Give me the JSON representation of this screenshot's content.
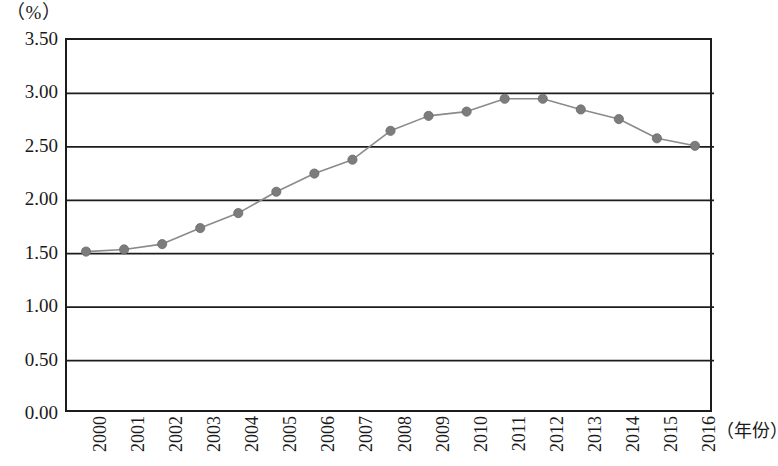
{
  "chart_data": {
    "type": "line",
    "title": "",
    "subtitle": "",
    "xlabel": "（年份）",
    "ylabel": "（%）",
    "unit_label": "（%）",
    "categories": [
      "2000",
      "2001",
      "2002",
      "2003",
      "2004",
      "2005",
      "2006",
      "2007",
      "2008",
      "2009",
      "2010",
      "2011",
      "2012",
      "2013",
      "2014",
      "2015",
      "2016"
    ],
    "values": [
      1.52,
      1.54,
      1.59,
      1.74,
      1.88,
      2.08,
      2.25,
      2.38,
      2.65,
      2.79,
      2.83,
      2.95,
      2.95,
      2.85,
      2.76,
      2.58,
      2.51
    ],
    "series": [
      {
        "name": "",
        "values": [
          1.52,
          1.54,
          1.59,
          1.74,
          1.88,
          2.08,
          2.25,
          2.38,
          2.65,
          2.79,
          2.83,
          2.95,
          2.95,
          2.85,
          2.76,
          2.58,
          2.51
        ]
      }
    ],
    "ylim": [
      0.0,
      3.5
    ],
    "ytick_values": [
      3.5,
      3.0,
      2.5,
      2.0,
      1.5,
      1.0,
      0.5,
      0.0
    ],
    "ytick_labels": [
      "3.50",
      "3.00",
      "2.50",
      "2.00",
      "1.50",
      "1.00",
      "0.50",
      "0.00"
    ],
    "grid": "horizontal",
    "legend": "none",
    "marker": "circle",
    "marker_color": "#7c7c7c",
    "line_color": "#8a8a8a",
    "axis_color": "#1c1c1c",
    "plot_background": "#ffffff"
  }
}
